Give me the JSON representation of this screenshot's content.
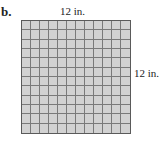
{
  "figure": {
    "part_label": "b.",
    "top_dimension": "12 in.",
    "side_dimension": "12 in.",
    "grid": {
      "rows": 12,
      "cols": 12
    },
    "colors": {
      "fill": "#d2d2d2",
      "lines": "#7a7a7a",
      "border": "#5a5a5a"
    }
  }
}
